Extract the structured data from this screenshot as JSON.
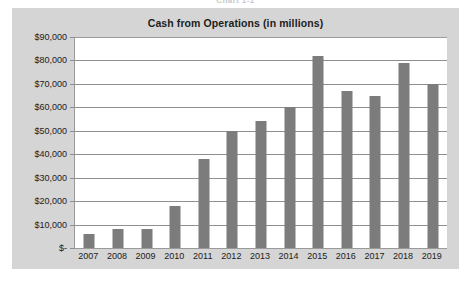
{
  "figure_label": "Chart 1-1",
  "caption": "",
  "chart": {
    "title": "Cash from Operations (in millions)",
    "panel_color": "#d5d5d5",
    "plot_color": "#ffffff",
    "bar_color": "#7c7c7c",
    "gridline_color": "#8f8f8f",
    "axis_color": "#9a9a9a"
  },
  "chart_data": {
    "type": "bar",
    "title": "Cash from Operations (in millions)",
    "xlabel": "",
    "ylabel": "",
    "ylim": [
      0,
      90000
    ],
    "ytick_values": [
      0,
      10000,
      20000,
      30000,
      40000,
      50000,
      60000,
      70000,
      80000,
      90000
    ],
    "ytick_labels": [
      "$-",
      "$10,000",
      "$20,000",
      "$30,000",
      "$40,000",
      "$50,000",
      "$60,000",
      "$70,000",
      "$80,000",
      "$90,000"
    ],
    "grid": true,
    "legend": false,
    "categories": [
      "2007",
      "2008",
      "2009",
      "2010",
      "2011",
      "2012",
      "2013",
      "2014",
      "2015",
      "2016",
      "2017",
      "2018",
      "2019"
    ],
    "values": [
      6000,
      8000,
      8000,
      18000,
      38000,
      50000,
      54000,
      60000,
      82000,
      67000,
      65000,
      79000,
      70000
    ]
  }
}
